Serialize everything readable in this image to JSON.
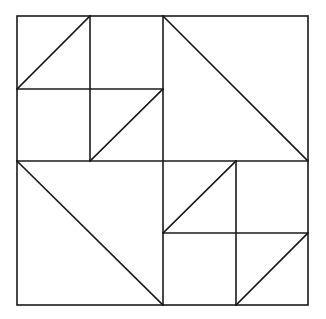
{
  "diagram": {
    "type": "quilt-block",
    "colors": {
      "stroke": "#1a1a1a",
      "background": "#ffffff"
    },
    "bounds": {
      "x1": 17,
      "y1": 16,
      "x2": 308,
      "y2": 305
    },
    "grid": {
      "xs": [
        17,
        90,
        163,
        236,
        308
      ],
      "ys": [
        16,
        89,
        161,
        233,
        305
      ]
    },
    "segments": [
      {
        "name": "midline-vertical",
        "x1": 163,
        "y1": 16,
        "x2": 163,
        "y2": 305
      },
      {
        "name": "midline-horizontal",
        "x1": 17,
        "y1": 161,
        "x2": 308,
        "y2": 161
      },
      {
        "name": "tl-quadrant-vertical",
        "x1": 90,
        "y1": 16,
        "x2": 90,
        "y2": 161
      },
      {
        "name": "tl-quadrant-horizontal",
        "x1": 17,
        "y1": 89,
        "x2": 163,
        "y2": 89
      },
      {
        "name": "tl-sub-tl-diagonal",
        "x1": 17,
        "y1": 89,
        "x2": 90,
        "y2": 16
      },
      {
        "name": "tl-sub-br-diagonal",
        "x1": 90,
        "y1": 161,
        "x2": 163,
        "y2": 89
      },
      {
        "name": "tr-quadrant-diagonal",
        "x1": 163,
        "y1": 16,
        "x2": 308,
        "y2": 161
      },
      {
        "name": "bl-quadrant-diagonal",
        "x1": 17,
        "y1": 161,
        "x2": 163,
        "y2": 305
      },
      {
        "name": "br-quadrant-vertical",
        "x1": 236,
        "y1": 161,
        "x2": 236,
        "y2": 305
      },
      {
        "name": "br-quadrant-horizontal",
        "x1": 163,
        "y1": 233,
        "x2": 308,
        "y2": 233
      },
      {
        "name": "br-sub-tl-diagonal",
        "x1": 163,
        "y1": 233,
        "x2": 236,
        "y2": 161
      },
      {
        "name": "br-sub-br-diagonal",
        "x1": 236,
        "y1": 305,
        "x2": 308,
        "y2": 233
      }
    ]
  }
}
